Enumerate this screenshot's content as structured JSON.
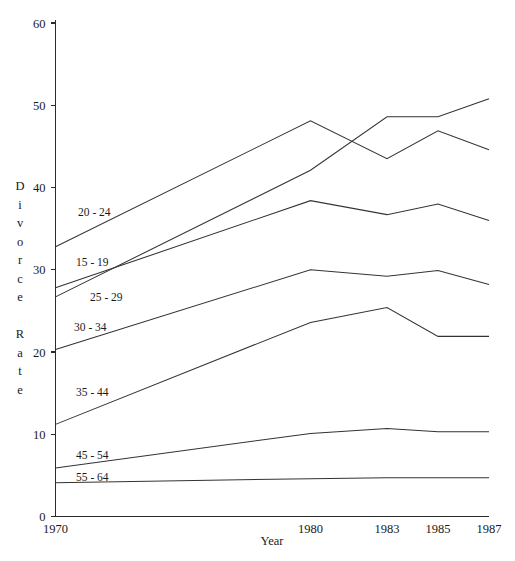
{
  "chart_data": {
    "type": "line",
    "title": "",
    "xlabel": "Year",
    "ylabel": "Divorce Rate",
    "x": [
      1970,
      1980,
      1983,
      1985,
      1987
    ],
    "xtick_labels": [
      "1970",
      "1980",
      "1983",
      "1985",
      "1987"
    ],
    "ytick_labels": [
      "0",
      "10",
      "20",
      "30",
      "40",
      "50",
      "60"
    ],
    "ytick_values": [
      0,
      10,
      20,
      30,
      40,
      50,
      60
    ],
    "xlim": [
      1970,
      1987
    ],
    "ylim": [
      0,
      60
    ],
    "grid": false,
    "legend_position": "inline-left",
    "series": [
      {
        "name": "20 - 24",
        "values": [
          32.8,
          48.1,
          43.5,
          46.9,
          44.6
        ]
      },
      {
        "name": "15 - 19",
        "values": [
          26.7,
          42.1,
          48.6,
          48.6,
          50.8
        ]
      },
      {
        "name": "25 - 29",
        "values": [
          27.8,
          38.4,
          36.7,
          38.0,
          36.0
        ]
      },
      {
        "name": "30 - 34",
        "values": [
          20.3,
          30.0,
          29.2,
          29.9,
          28.2
        ]
      },
      {
        "name": "35 - 44",
        "values": [
          11.2,
          23.6,
          25.4,
          21.9,
          21.9
        ]
      },
      {
        "name": "45 - 54",
        "values": [
          5.9,
          10.1,
          10.7,
          10.3,
          10.3
        ]
      },
      {
        "name": "55 - 64",
        "values": [
          4.1,
          4.6,
          4.7,
          4.7,
          4.7
        ]
      }
    ],
    "series_label_positions": [
      {
        "name": "20 - 24",
        "x": 78,
        "y": 216
      },
      {
        "name": "15 - 19",
        "x": 76,
        "y": 266
      },
      {
        "name": "25 - 29",
        "x": 90,
        "y": 301
      },
      {
        "name": "30 - 34",
        "x": 74,
        "y": 331
      },
      {
        "name": "35 - 44",
        "x": 76,
        "y": 396
      },
      {
        "name": "45 - 54",
        "x": 76,
        "y": 459
      },
      {
        "name": "55 - 64",
        "x": 76,
        "y": 481
      }
    ],
    "ylabel_chars": [
      "D",
      "i",
      "v",
      "o",
      "r",
      "c",
      "e",
      "",
      "R",
      "a",
      "t",
      "e"
    ],
    "colors": {
      "line": "#333333",
      "axis": "#2b2b2b",
      "text": "#1a1a1a",
      "background": "#ffffff"
    }
  }
}
